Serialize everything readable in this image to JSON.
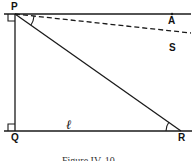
{
  "figure": {
    "caption": "Figure IV. 10",
    "points": {
      "P": "P",
      "A": "A",
      "S": "S",
      "Q": "Q",
      "R": "R"
    },
    "line_label": "ℓ",
    "stroke_color": "#1a1a1a",
    "background": "#ffffff"
  }
}
